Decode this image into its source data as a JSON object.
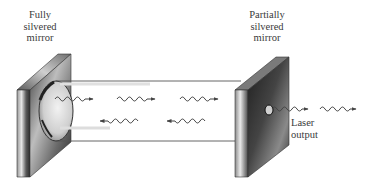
{
  "diagram": {
    "labels": {
      "left_mirror": [
        "Fully",
        "silvered",
        "mirror"
      ],
      "right_mirror": [
        "Partially",
        "silvered",
        "mirror"
      ],
      "output": [
        "Laser",
        "output"
      ]
    },
    "components": [
      {
        "id": "fully-silvered-mirror",
        "type": "mirror",
        "reflectivity": "full"
      },
      {
        "id": "partially-silvered-mirror",
        "type": "mirror",
        "reflectivity": "partial",
        "has_aperture": true
      },
      {
        "id": "gain-cylinder",
        "type": "cavity"
      }
    ],
    "waves": {
      "rightward_in_cavity": 3,
      "leftward_in_cavity": 2,
      "output_waves": 2
    },
    "colors": {
      "line": "#555555",
      "mirror_dark": "#2a2a2a",
      "mirror_light": "#d8d8d8",
      "text": "#3a3a3a"
    }
  }
}
